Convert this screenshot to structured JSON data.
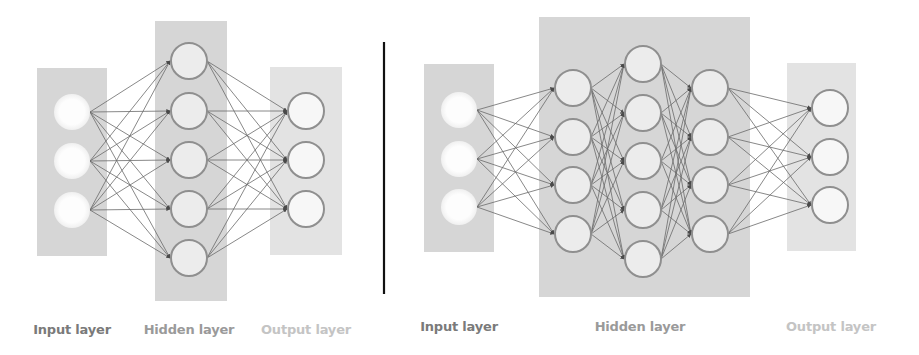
{
  "colors": {
    "background": "#ffffff",
    "layer_box": "#d6d6d6",
    "output_box": "#e3e3e3",
    "node_fill": "#ececec",
    "node_stroke": "#8f8f8f",
    "input_node_fill": "#fbfbfb",
    "edge": "#6a6a6a",
    "divider": "#111111",
    "label_input": "#7a7a7a",
    "label_hidden": "#9a9a9a",
    "label_output": "#c4c4c4"
  },
  "divider": {
    "x": 384,
    "y1": 42,
    "y2": 294
  },
  "diagrams": [
    {
      "name": "shallow-network",
      "boxes": [
        {
          "role": "input",
          "x": 37,
          "y": 68,
          "w": 70,
          "h": 188
        },
        {
          "role": "hidden",
          "x": 155,
          "y": 21,
          "w": 72,
          "h": 280
        },
        {
          "role": "output",
          "x": 270,
          "y": 67,
          "w": 72,
          "h": 188
        }
      ],
      "layers": [
        {
          "role": "input",
          "cx": 72,
          "ys": [
            112,
            161,
            210
          ]
        },
        {
          "role": "hidden",
          "cx": 189,
          "ys": [
            61,
            111,
            160,
            209,
            258
          ]
        },
        {
          "role": "output",
          "cx": 306,
          "ys": [
            111,
            160,
            209
          ]
        }
      ],
      "labels": [
        {
          "text": "Input layer",
          "x": 72,
          "y": 322,
          "role": "input"
        },
        {
          "text": "Hidden layer",
          "x": 189,
          "y": 322,
          "role": "hidden"
        },
        {
          "text": "Output layer",
          "x": 306,
          "y": 322,
          "role": "output"
        }
      ]
    },
    {
      "name": "deep-network",
      "boxes": [
        {
          "role": "input",
          "x": 424,
          "y": 64,
          "w": 70,
          "h": 188
        },
        {
          "role": "hidden",
          "x": 539,
          "y": 17,
          "w": 211,
          "h": 280
        },
        {
          "role": "output",
          "x": 787,
          "y": 63,
          "w": 69,
          "h": 188
        }
      ],
      "layers": [
        {
          "role": "input",
          "cx": 459,
          "ys": [
            110,
            159,
            207
          ]
        },
        {
          "role": "hidden",
          "cx": 573,
          "ys": [
            88,
            137,
            185,
            234
          ]
        },
        {
          "role": "hidden",
          "cx": 643,
          "ys": [
            64,
            113,
            161,
            210,
            259
          ]
        },
        {
          "role": "hidden",
          "cx": 710,
          "ys": [
            88,
            137,
            185,
            234
          ]
        },
        {
          "role": "output",
          "cx": 830,
          "ys": [
            108,
            157,
            205
          ]
        }
      ],
      "labels": [
        {
          "text": "Input layer",
          "x": 459,
          "y": 319,
          "role": "input"
        },
        {
          "text": "Hidden layer",
          "x": 640,
          "y": 319,
          "role": "hidden"
        },
        {
          "text": "Output layer",
          "x": 831,
          "y": 319,
          "role": "output"
        }
      ]
    }
  ],
  "node_radius": 18
}
